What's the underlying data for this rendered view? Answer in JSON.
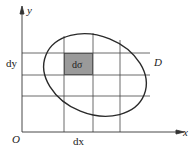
{
  "diagram": {
    "axes": {
      "x_label": "x",
      "y_label": "y",
      "origin_label": "O"
    },
    "region_label": "D",
    "element_label": "dσ",
    "dx_label": "dx",
    "dy_label": "dy",
    "colors": {
      "line": "#333333",
      "grid": "#444444",
      "shaded_cell": "#9a9a9a",
      "background": "#ffffff"
    }
  }
}
